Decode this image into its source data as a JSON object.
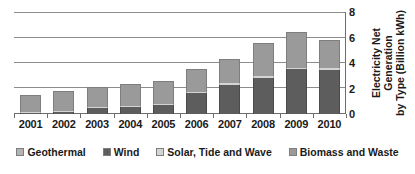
{
  "chart_data": {
    "type": "bar",
    "stacked": true,
    "title": "",
    "xlabel": "",
    "ylabel": "Electricity Net Generation by Type (Billion kWh)",
    "categories": [
      "2001",
      "2002",
      "2003",
      "2004",
      "2005",
      "2006",
      "2007",
      "2008",
      "2009",
      "2010"
    ],
    "ylim": [
      0,
      8
    ],
    "yticks": [
      0,
      2,
      4,
      6,
      8
    ],
    "grid": true,
    "y_axis_position": "right",
    "legend_position": "bottom",
    "series": [
      {
        "name": "Geothermal",
        "color": "#b3b3b3",
        "values": [
          0.0,
          0.0,
          0.0,
          0.0,
          0.0,
          0.0,
          0.0,
          0.0,
          0.0,
          0.0
        ]
      },
      {
        "name": "Wind",
        "color": "#5d5d5d",
        "values": [
          0.07,
          0.14,
          0.5,
          0.52,
          0.68,
          1.62,
          2.3,
          2.85,
          3.5,
          3.45
        ]
      },
      {
        "name": "Solar, Tide and Wave",
        "color": "#d4d4d4",
        "values": [
          0.03,
          0.06,
          0.08,
          0.06,
          0.07,
          0.08,
          0.1,
          0.12,
          0.14,
          0.14
        ]
      },
      {
        "name": "Biomass and Waste",
        "color": "#9a9a9a",
        "values": [
          1.3,
          1.6,
          1.52,
          1.72,
          1.85,
          1.8,
          1.9,
          2.63,
          2.76,
          2.21
        ]
      }
    ]
  },
  "axis_title": {
    "line1": "Electricity Net Generation",
    "line2": "by Type (Billion kWh)"
  },
  "legend": {
    "items": [
      {
        "label": "Geothermal"
      },
      {
        "label": "Wind"
      },
      {
        "label": "Solar, Tide and Wave"
      },
      {
        "label": "Biomass and Waste"
      }
    ]
  }
}
